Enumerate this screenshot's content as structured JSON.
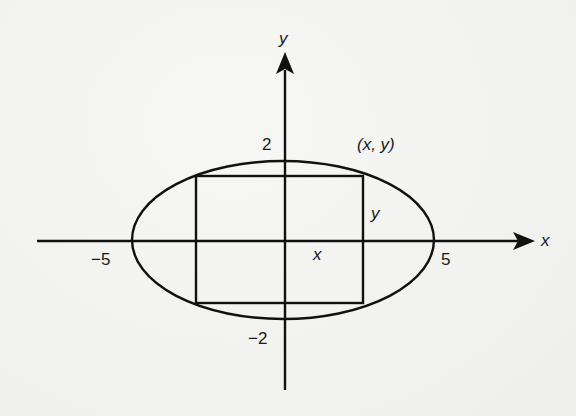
{
  "diagram": {
    "type": "ellipse-with-inscribed-rectangle",
    "axes": {
      "x_label": "x",
      "y_label": "y"
    },
    "ticks": {
      "x_neg": "−5",
      "x_pos": "5",
      "y_pos": "2",
      "y_neg": "−2"
    },
    "point_label": "(x, y)",
    "rect_half_width_label": "x",
    "rect_half_height_label": "y",
    "colors": {
      "ink": "#111111",
      "paper": "#f3f3f2"
    }
  }
}
